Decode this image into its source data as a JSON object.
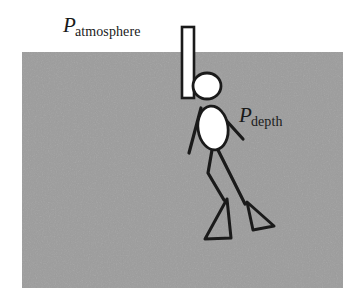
{
  "figure": {
    "background_color": "#ffffff",
    "water": {
      "name": "water-region",
      "fill_color": "#9d9d9d",
      "x": 22,
      "y": 52,
      "width": 321,
      "height": 236
    },
    "labels": [
      {
        "id": "atmosphere",
        "symbol": "P",
        "subscript": "atmosphere",
        "color": "#1a1a1a",
        "x": 63,
        "y": 15
      },
      {
        "id": "depth",
        "symbol": "P",
        "subscript": "depth",
        "color": "#1a1a1a",
        "x": 239,
        "y": 105
      }
    ],
    "snorkel_tube": {
      "name": "snorkel-tube",
      "fill_color": "#ffffff",
      "stroke_color": "#1a1a1a",
      "x": 182,
      "y": 27,
      "width": 12,
      "height": 71
    },
    "diver": {
      "name": "diver-figure",
      "stroke_color": "#1a1a1a",
      "fill_color": "#ffffff",
      "head": {
        "cx": 207,
        "cy": 86,
        "rx": 14,
        "ry": 13
      },
      "torso": {
        "cx": 213,
        "cy": 128,
        "rx": 15,
        "ry": 22,
        "rotation": -8
      },
      "arm_left": {
        "x1": 201,
        "y1": 108,
        "x2": 189,
        "y2": 153
      },
      "arm_right": {
        "x1": 215,
        "y1": 108,
        "x2": 243,
        "y2": 139
      },
      "leg_front": [
        [
          212,
          150
        ],
        [
          208,
          173
        ],
        [
          224,
          200
        ]
      ],
      "leg_back": [
        [
          218,
          150
        ],
        [
          232,
          178
        ],
        [
          245,
          204
        ]
      ],
      "flipper_front": [
        [
          227,
          199
        ],
        [
          205,
          239
        ],
        [
          231,
          238
        ]
      ],
      "flipper_back": [
        [
          247,
          202
        ],
        [
          253,
          230
        ],
        [
          274,
          226
        ]
      ]
    }
  }
}
